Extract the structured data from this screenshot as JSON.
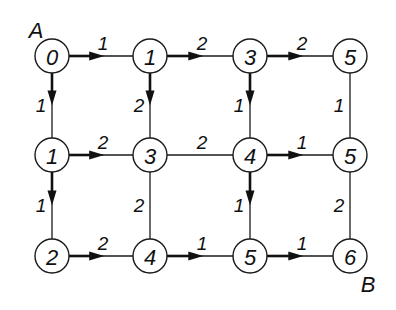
{
  "diagram": {
    "type": "weighted-grid-graph-shortest-path",
    "start_label": "A",
    "end_label": "B",
    "nodes": [
      {
        "id": "r0c0",
        "label": "0",
        "x": 52,
        "y": 56
      },
      {
        "id": "r0c1",
        "label": "1",
        "x": 150,
        "y": 56
      },
      {
        "id": "r0c2",
        "label": "3",
        "x": 250,
        "y": 56
      },
      {
        "id": "r0c3",
        "label": "5",
        "x": 350,
        "y": 56
      },
      {
        "id": "r1c0",
        "label": "1",
        "x": 52,
        "y": 155
      },
      {
        "id": "r1c1",
        "label": "3",
        "x": 150,
        "y": 155
      },
      {
        "id": "r1c2",
        "label": "4",
        "x": 250,
        "y": 155
      },
      {
        "id": "r1c3",
        "label": "5",
        "x": 350,
        "y": 155
      },
      {
        "id": "r2c0",
        "label": "2",
        "x": 52,
        "y": 256
      },
      {
        "id": "r2c1",
        "label": "4",
        "x": 150,
        "y": 256
      },
      {
        "id": "r2c2",
        "label": "5",
        "x": 250,
        "y": 256
      },
      {
        "id": "r2c3",
        "label": "6",
        "x": 350,
        "y": 256
      }
    ],
    "edges": [
      {
        "from": "r0c0",
        "to": "r0c1",
        "weight": "1",
        "directed": true
      },
      {
        "from": "r0c1",
        "to": "r0c2",
        "weight": "2",
        "directed": true
      },
      {
        "from": "r0c2",
        "to": "r0c3",
        "weight": "2",
        "directed": true
      },
      {
        "from": "r1c0",
        "to": "r1c1",
        "weight": "2",
        "directed": true
      },
      {
        "from": "r1c1",
        "to": "r1c2",
        "weight": "2",
        "directed": false
      },
      {
        "from": "r1c2",
        "to": "r1c3",
        "weight": "1",
        "directed": true
      },
      {
        "from": "r2c0",
        "to": "r2c1",
        "weight": "2",
        "directed": true
      },
      {
        "from": "r2c1",
        "to": "r2c2",
        "weight": "1",
        "directed": true
      },
      {
        "from": "r2c2",
        "to": "r2c3",
        "weight": "1",
        "directed": true
      },
      {
        "from": "r0c0",
        "to": "r1c0",
        "weight": "1",
        "directed": true
      },
      {
        "from": "r1c0",
        "to": "r2c0",
        "weight": "1",
        "directed": true
      },
      {
        "from": "r0c1",
        "to": "r1c1",
        "weight": "2",
        "directed": true
      },
      {
        "from": "r1c1",
        "to": "r2c1",
        "weight": "2",
        "directed": false
      },
      {
        "from": "r0c2",
        "to": "r1c2",
        "weight": "1",
        "directed": true
      },
      {
        "from": "r1c2",
        "to": "r2c2",
        "weight": "1",
        "directed": true
      },
      {
        "from": "r0c3",
        "to": "r1c3",
        "weight": "1",
        "directed": false
      },
      {
        "from": "r1c3",
        "to": "r2c3",
        "weight": "2",
        "directed": false
      }
    ]
  }
}
